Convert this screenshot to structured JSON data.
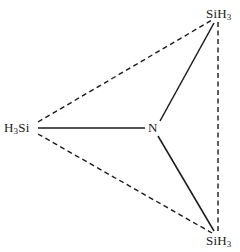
{
  "diagram": {
    "molecule_formula": "N(SiH3)3",
    "background_color": "#ffffff",
    "line_color": "#1a1a1a",
    "labels": {
      "si_top": {
        "prefix": "SiH",
        "subscript": "3"
      },
      "si_left": {
        "prefix": "H",
        "subscript": "3",
        "suffix": "Si"
      },
      "si_bottom": {
        "prefix": "SiH",
        "subscript": "3"
      },
      "nitrogen": {
        "text": "N"
      }
    },
    "atoms": [
      {
        "id": "n-center",
        "element": "N",
        "x": 153,
        "y": 128
      },
      {
        "id": "si-top",
        "element": "SiH3",
        "x": 218,
        "y": 20
      },
      {
        "id": "si-left",
        "element": "SiH3",
        "x": 36,
        "y": 128
      },
      {
        "id": "si-bottom",
        "element": "SiH3",
        "x": 218,
        "y": 233
      }
    ],
    "bonds": [
      {
        "id": "bond-n-si-left",
        "from": "n-center",
        "to": "si-left",
        "style": "solid",
        "x1": 145,
        "y1": 128,
        "x2": 38,
        "y2": 128
      },
      {
        "id": "bond-n-si-top",
        "from": "n-center",
        "to": "si-top",
        "style": "solid",
        "x1": 160,
        "y1": 121,
        "x2": 214,
        "y2": 23
      },
      {
        "id": "bond-n-si-bottom",
        "from": "n-center",
        "to": "si-bottom",
        "style": "solid",
        "x1": 158,
        "y1": 136,
        "x2": 214,
        "y2": 231
      }
    ],
    "guide_lines": [
      {
        "id": "guide-left-top",
        "from": "si-left",
        "to": "si-top",
        "style": "dashed",
        "x1": 38,
        "y1": 122,
        "x2": 212,
        "y2": 20
      },
      {
        "id": "guide-left-bottom",
        "from": "si-left",
        "to": "si-bottom",
        "style": "dashed",
        "x1": 38,
        "y1": 134,
        "x2": 212,
        "y2": 233
      },
      {
        "id": "guide-top-bottom",
        "from": "si-top",
        "to": "si-bottom",
        "style": "dashed",
        "x1": 218,
        "y1": 22,
        "x2": 218,
        "y2": 231
      }
    ]
  }
}
